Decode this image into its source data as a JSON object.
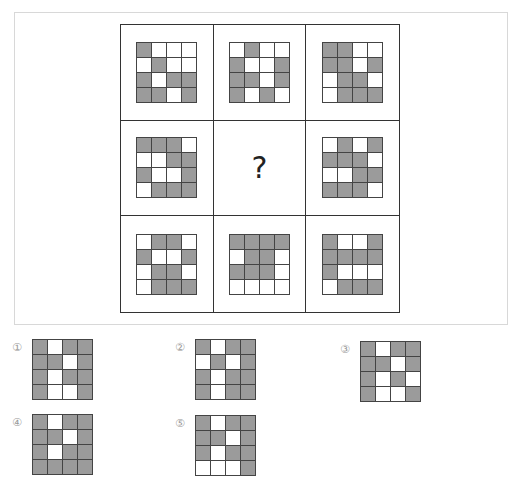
{
  "puzzle": {
    "question_mark": "?",
    "colors": {
      "gray": "#9b9b9b",
      "white": "#ffffff",
      "border": "#333333"
    },
    "cells": [
      {
        "row": 1,
        "col": 1,
        "pattern": [
          [
            "G",
            "W",
            "W",
            "W"
          ],
          [
            "W",
            "G",
            "W",
            "W"
          ],
          [
            "G",
            "W",
            "G",
            "G"
          ],
          [
            "G",
            "G",
            "W",
            "G"
          ]
        ]
      },
      {
        "row": 1,
        "col": 2,
        "pattern": [
          [
            "W",
            "G",
            "W",
            "W"
          ],
          [
            "G",
            "W",
            "W",
            "G"
          ],
          [
            "G",
            "G",
            "W",
            "G"
          ],
          [
            "G",
            "W",
            "G",
            "W"
          ]
        ]
      },
      {
        "row": 1,
        "col": 3,
        "pattern": [
          [
            "G",
            "G",
            "W",
            "W"
          ],
          [
            "G",
            "G",
            "W",
            "G"
          ],
          [
            "W",
            "G",
            "G",
            "W"
          ],
          [
            "W",
            "G",
            "G",
            "G"
          ]
        ]
      },
      {
        "row": 2,
        "col": 1,
        "pattern": [
          [
            "G",
            "G",
            "G",
            "W"
          ],
          [
            "W",
            "W",
            "G",
            "G"
          ],
          [
            "G",
            "W",
            "W",
            "G"
          ],
          [
            "W",
            "G",
            "G",
            "G"
          ]
        ]
      },
      {
        "row": 2,
        "col": 2,
        "missing": true,
        "label": "?"
      },
      {
        "row": 2,
        "col": 3,
        "pattern": [
          [
            "W",
            "G",
            "W",
            "G"
          ],
          [
            "G",
            "G",
            "G",
            "W"
          ],
          [
            "W",
            "W",
            "G",
            "G"
          ],
          [
            "G",
            "G",
            "G",
            "W"
          ]
        ]
      },
      {
        "row": 3,
        "col": 1,
        "pattern": [
          [
            "W",
            "G",
            "G",
            "W"
          ],
          [
            "G",
            "W",
            "W",
            "G"
          ],
          [
            "W",
            "G",
            "G",
            "W"
          ],
          [
            "W",
            "G",
            "G",
            "G"
          ]
        ]
      },
      {
        "row": 3,
        "col": 2,
        "pattern": [
          [
            "G",
            "G",
            "G",
            "G"
          ],
          [
            "W",
            "G",
            "G",
            "W"
          ],
          [
            "G",
            "G",
            "G",
            "W"
          ],
          [
            "W",
            "W",
            "W",
            "W"
          ]
        ]
      },
      {
        "row": 3,
        "col": 3,
        "pattern": [
          [
            "G",
            "W",
            "W",
            "G"
          ],
          [
            "G",
            "G",
            "G",
            "G"
          ],
          [
            "G",
            "W",
            "W",
            "W"
          ],
          [
            "W",
            "G",
            "G",
            "G"
          ]
        ]
      }
    ]
  },
  "options": [
    {
      "number": "①",
      "pattern": [
        [
          "G",
          "W",
          "G",
          "G"
        ],
        [
          "G",
          "G",
          "W",
          "G"
        ],
        [
          "G",
          "W",
          "G",
          "G"
        ],
        [
          "G",
          "W",
          "W",
          "G"
        ]
      ]
    },
    {
      "number": "②",
      "pattern": [
        [
          "G",
          "W",
          "G",
          "G"
        ],
        [
          "W",
          "G",
          "W",
          "G"
        ],
        [
          "G",
          "W",
          "G",
          "G"
        ],
        [
          "G",
          "W",
          "G",
          "G"
        ]
      ]
    },
    {
      "number": "③",
      "pattern": [
        [
          "G",
          "W",
          "G",
          "G"
        ],
        [
          "G",
          "G",
          "W",
          "G"
        ],
        [
          "G",
          "W",
          "G",
          "W"
        ],
        [
          "G",
          "W",
          "W",
          "G"
        ]
      ]
    },
    {
      "number": "④",
      "pattern": [
        [
          "G",
          "W",
          "G",
          "G"
        ],
        [
          "G",
          "G",
          "W",
          "G"
        ],
        [
          "G",
          "W",
          "G",
          "G"
        ],
        [
          "G",
          "G",
          "G",
          "G"
        ]
      ]
    },
    {
      "number": "⑤",
      "pattern": [
        [
          "G",
          "W",
          "G",
          "G"
        ],
        [
          "G",
          "G",
          "W",
          "G"
        ],
        [
          "G",
          "W",
          "G",
          "G"
        ],
        [
          "W",
          "W",
          "W",
          "G"
        ]
      ]
    }
  ]
}
